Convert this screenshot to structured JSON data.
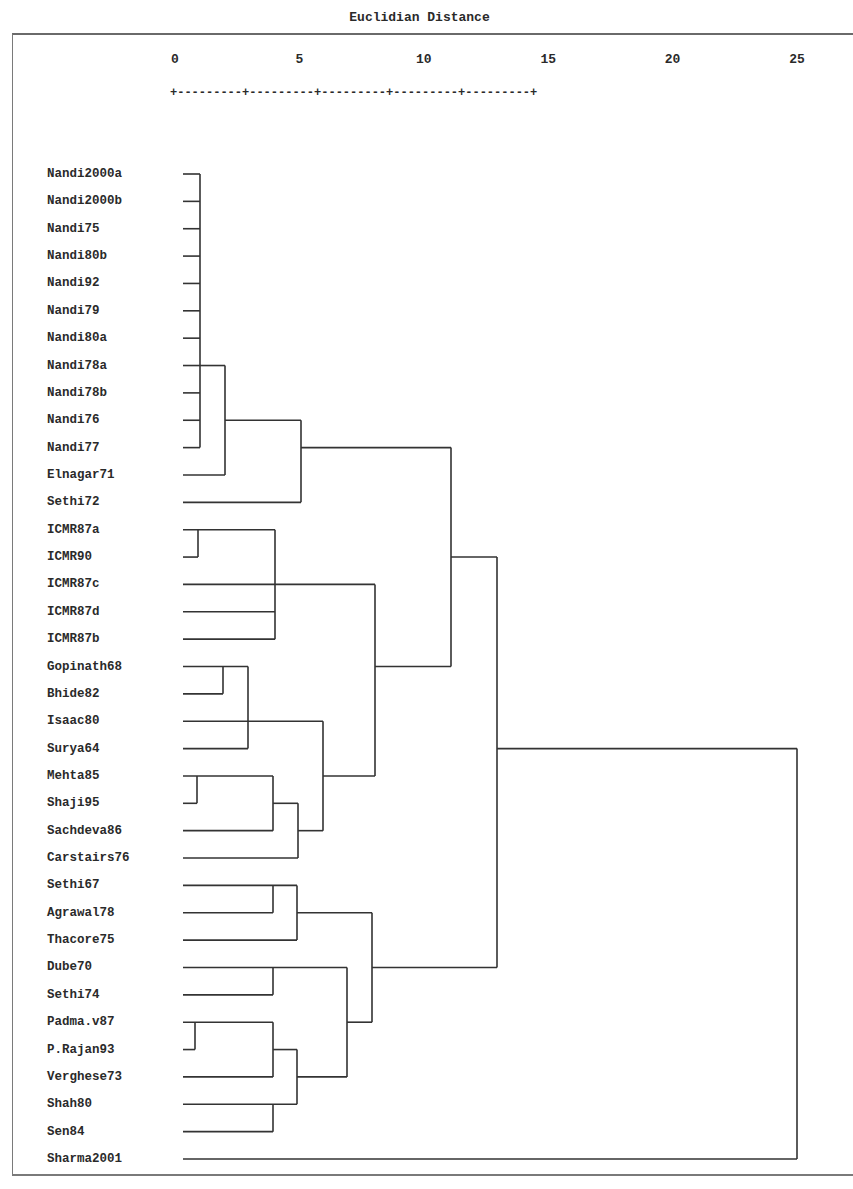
{
  "chart_data": {
    "type": "dendrogram",
    "title": "Euclidian Distance",
    "xlabel": "Euclidian Distance",
    "ylabel": "",
    "xlim": [
      0,
      25
    ],
    "x_ticks": [
      "0",
      "5",
      "10",
      "15",
      "20",
      "25"
    ],
    "axis_rule": "+---------+---------+---------+---------+---------+",
    "leaves": [
      "Nandi2000a",
      "Nandi2000b",
      "Nandi75",
      "Nandi80b",
      "Nandi92",
      "Nandi79",
      "Nandi80a",
      "Nandi78a",
      "Nandi78b",
      "Nandi76",
      "Nandi77",
      "Elnagar71",
      "Sethi72",
      "ICMR87a",
      "ICMR90",
      "ICMR87c",
      "ICMR87d",
      "ICMR87b",
      "Gopinath68",
      "Bhide82",
      "Isaac80",
      "Surya64",
      "Mehta85",
      "Shaji95",
      "Sachdeva86",
      "Carstairs76",
      "Sethi67",
      "Agrawal78",
      "Thacore75",
      "Dube70",
      "Sethi74",
      "Padma.v87",
      "P.Rajan93",
      "Verghese73",
      "Shah80",
      "Sen84",
      "Sharma2001"
    ],
    "merges": [
      {
        "members": [
          "Nandi2000a",
          "Nandi2000b",
          "Nandi75",
          "Nandi80b",
          "Nandi92",
          "Nandi79",
          "Nandi80a",
          "Nandi78a",
          "Nandi78b",
          "Nandi76",
          "Nandi77"
        ],
        "distance": 1
      },
      {
        "members": [
          "Nandi-cluster",
          "Elnagar71"
        ],
        "distance": 2
      },
      {
        "members": [
          "Nandi-Elnagar",
          "Sethi72"
        ],
        "distance": 5
      },
      {
        "members": [
          "ICMR87a",
          "ICMR90"
        ],
        "distance": 1
      },
      {
        "members": [
          "ICMR87a-ICMR90",
          "ICMR87c",
          "ICMR87d",
          "ICMR87b"
        ],
        "distance": 4
      },
      {
        "members": [
          "Gopinath68",
          "Bhide82"
        ],
        "distance": 2
      },
      {
        "members": [
          "Gopinath68-Bhide82",
          "Surya64"
        ],
        "distance": 3
      },
      {
        "members": [
          "Mehta85",
          "Shaji95"
        ],
        "distance": 1
      },
      {
        "members": [
          "Mehta85-Shaji95",
          "Sachdeva86"
        ],
        "distance": 4
      },
      {
        "members": [
          "Mehta-Shaji-Sachdeva",
          "Carstairs76"
        ],
        "distance": 5
      },
      {
        "members": [
          "Gopinath-Bhide-Surya",
          "Isaac80",
          "Mehta-Shaji-Sachdeva-Carstairs"
        ],
        "distance": 6
      },
      {
        "members": [
          "ICMR-cluster",
          "Gopinath-Mehta-cluster"
        ],
        "distance": 8
      },
      {
        "members": [
          "Nandi-Elnagar-Sethi72",
          "ICMR-Gopinath-Mehta"
        ],
        "distance": 11
      },
      {
        "members": [
          "Sethi67",
          "Agrawal78"
        ],
        "distance": 4
      },
      {
        "members": [
          "Sethi67-Agrawal78",
          "Thacore75"
        ],
        "distance": 5
      },
      {
        "members": [
          "Dube70",
          "Sethi74"
        ],
        "distance": 4
      },
      {
        "members": [
          "Padma.v87",
          "P.Rajan93"
        ],
        "distance": 1
      },
      {
        "members": [
          "Padma-Rajan",
          "Verghese73"
        ],
        "distance": 4
      },
      {
        "members": [
          "Shah80",
          "Sen84"
        ],
        "distance": 4
      },
      {
        "members": [
          "Padma-Rajan-Verghese",
          "Shah80-Sen84"
        ],
        "distance": 5
      },
      {
        "members": [
          "Dube70-Sethi74",
          "Padma-Shah-group"
        ],
        "distance": 7
      },
      {
        "members": [
          "Sethi67-Agrawal-Thacore",
          "Dube-Padma-group"
        ],
        "distance": 8
      },
      {
        "members": [
          "upper-group",
          "lower-group"
        ],
        "distance": 13
      },
      {
        "members": [
          "all-others",
          "Sharma2001"
        ],
        "distance": 25
      }
    ],
    "grid": false,
    "legend": null
  }
}
